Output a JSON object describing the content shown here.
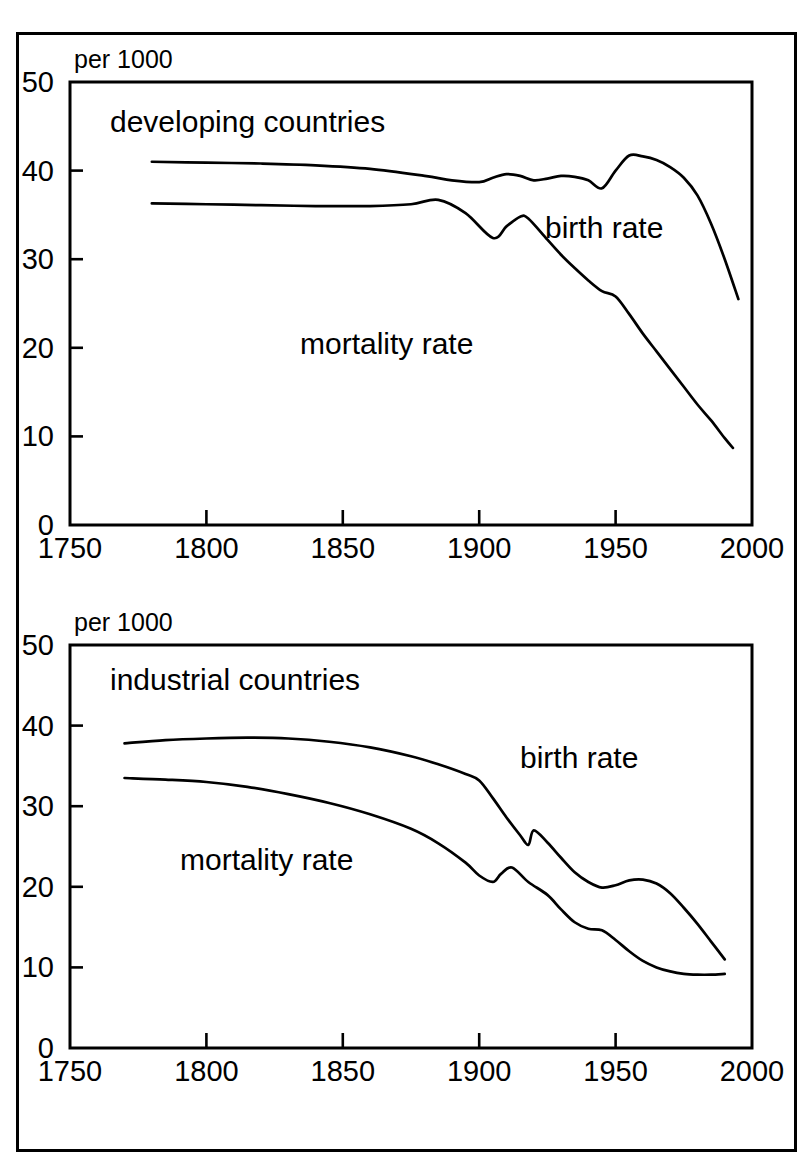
{
  "figure": {
    "background_color": "#ffffff",
    "ink_color": "#000000",
    "border": {
      "x": 16,
      "y": 32,
      "width": 781,
      "height": 1120,
      "stroke_width": 3
    }
  },
  "chart_data": [
    {
      "type": "line",
      "panel": "top",
      "title": "developing countries",
      "unit_label": "per 1000",
      "xlabel": "",
      "ylabel": "",
      "xlim": [
        1750,
        2000
      ],
      "ylim": [
        0,
        50
      ],
      "xticks": [
        1750,
        1800,
        1850,
        1900,
        1950,
        2000
      ],
      "yticks": [
        0,
        10,
        20,
        30,
        40,
        50
      ],
      "grid": false,
      "legend_position": "inline-annotations",
      "plot_box": {
        "x": 70,
        "y": 82,
        "width": 682,
        "height": 443
      },
      "series": [
        {
          "name": "birth rate",
          "label_position": {
            "x": 545,
            "y": 238
          },
          "x": [
            1780,
            1800,
            1820,
            1840,
            1860,
            1880,
            1890,
            1900,
            1905,
            1910,
            1915,
            1920,
            1925,
            1930,
            1935,
            1940,
            1945,
            1950,
            1955,
            1960,
            1965,
            1970,
            1975,
            1980,
            1985,
            1990,
            1995
          ],
          "values": [
            41.0,
            40.9,
            40.8,
            40.6,
            40.2,
            39.4,
            38.9,
            38.7,
            39.2,
            39.6,
            39.4,
            38.9,
            39.1,
            39.4,
            39.3,
            38.9,
            38.0,
            40.0,
            41.7,
            41.6,
            41.2,
            40.4,
            39.2,
            37.2,
            34.0,
            30.0,
            25.5
          ]
        },
        {
          "name": "mortality rate",
          "label_position": {
            "x": 300,
            "y": 354
          },
          "x": [
            1780,
            1800,
            1820,
            1840,
            1860,
            1875,
            1885,
            1895,
            1905,
            1910,
            1915,
            1918,
            1925,
            1930,
            1935,
            1940,
            1945,
            1950,
            1955,
            1960,
            1965,
            1970,
            1975,
            1980,
            1985,
            1990,
            1993
          ],
          "values": [
            36.3,
            36.2,
            36.1,
            36.0,
            36.0,
            36.2,
            36.7,
            35.2,
            32.4,
            33.7,
            34.8,
            34.6,
            32.2,
            30.5,
            29.0,
            27.6,
            26.4,
            25.8,
            23.8,
            21.6,
            19.6,
            17.6,
            15.6,
            13.6,
            11.8,
            9.8,
            8.7
          ]
        }
      ]
    },
    {
      "type": "line",
      "panel": "bottom",
      "title": "industrial countries",
      "unit_label": "per 1000",
      "xlabel": "",
      "ylabel": "",
      "xlim": [
        1750,
        2000
      ],
      "ylim": [
        0,
        50
      ],
      "xticks": [
        1750,
        1800,
        1850,
        1900,
        1950,
        2000
      ],
      "yticks": [
        0,
        10,
        20,
        30,
        40,
        50
      ],
      "grid": false,
      "legend_position": "inline-annotations",
      "plot_box": {
        "x": 70,
        "y": 645,
        "width": 682,
        "height": 403
      },
      "series": [
        {
          "name": "birth rate",
          "label_position": {
            "x": 520,
            "y": 768
          },
          "x": [
            1770,
            1785,
            1800,
            1815,
            1830,
            1845,
            1860,
            1875,
            1885,
            1895,
            1900,
            1905,
            1910,
            1915,
            1918,
            1920,
            1925,
            1930,
            1935,
            1940,
            1945,
            1950,
            1955,
            1960,
            1965,
            1970,
            1975,
            1980,
            1985,
            1990
          ],
          "values": [
            37.8,
            38.2,
            38.4,
            38.5,
            38.4,
            38.0,
            37.3,
            36.2,
            35.2,
            34.0,
            33.2,
            31.0,
            28.6,
            26.4,
            25.2,
            27.0,
            25.5,
            23.6,
            21.8,
            20.6,
            19.9,
            20.2,
            20.8,
            20.9,
            20.4,
            19.2,
            17.4,
            15.4,
            13.2,
            11.0
          ]
        },
        {
          "name": "mortality rate",
          "label_position": {
            "x": 180,
            "y": 870
          },
          "x": [
            1770,
            1785,
            1800,
            1815,
            1830,
            1845,
            1860,
            1875,
            1885,
            1895,
            1900,
            1905,
            1908,
            1912,
            1918,
            1925,
            1930,
            1935,
            1940,
            1945,
            1950,
            1955,
            1960,
            1965,
            1970,
            1975,
            1980,
            1985,
            1990
          ],
          "values": [
            33.5,
            33.3,
            33.0,
            32.4,
            31.5,
            30.4,
            29.0,
            27.2,
            25.4,
            23.0,
            21.4,
            20.6,
            21.6,
            22.4,
            20.6,
            19.0,
            17.2,
            15.6,
            14.8,
            14.6,
            13.4,
            12.0,
            10.8,
            10.0,
            9.5,
            9.2,
            9.1,
            9.1,
            9.2
          ]
        }
      ]
    }
  ]
}
